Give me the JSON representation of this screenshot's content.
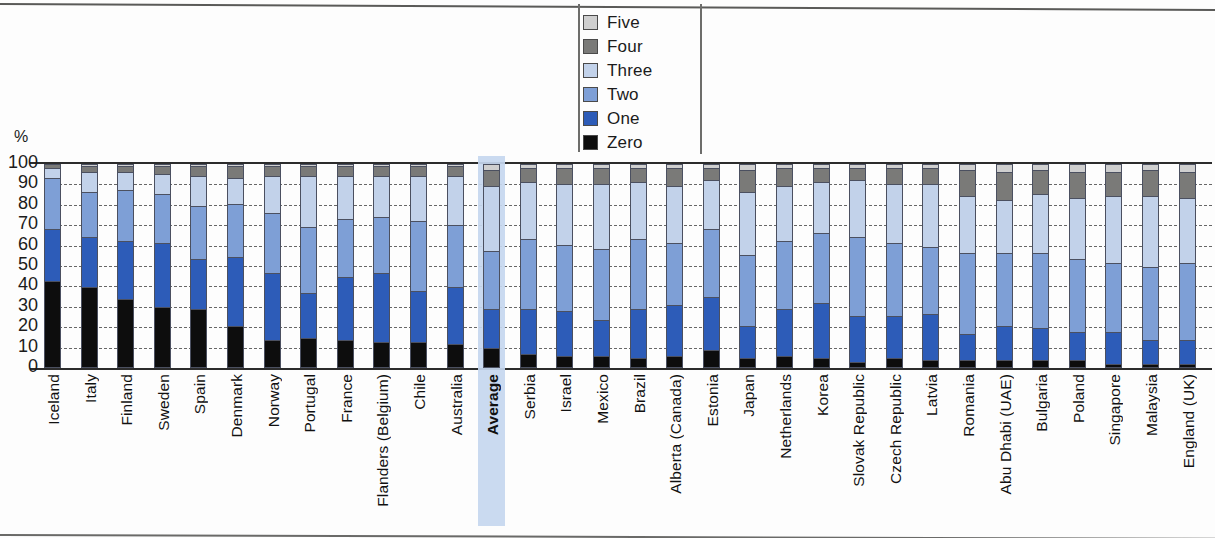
{
  "chart_data": {
    "type": "bar",
    "subtype": "stacked-bar-100",
    "title": "",
    "xlabel": "",
    "ylabel": "%",
    "ylim": [
      0,
      100
    ],
    "ytick_labels": [
      "100",
      "90",
      "80",
      "70",
      "60",
      "50",
      "40",
      "30",
      "20",
      "10",
      "0"
    ],
    "yticks": [
      100,
      90,
      80,
      70,
      60,
      50,
      40,
      30,
      20,
      10,
      0
    ],
    "grid": "horizontal-dashed",
    "legend_position": "top-center",
    "highlighted_category": "Average",
    "legend": [
      "Five",
      "Four",
      "Three",
      "Two",
      "One",
      "Zero"
    ],
    "colors": {
      "Five": "#cfcfcf",
      "Four": "#7a7a78",
      "Three": "#c2d2ea",
      "Two": "#7e9fd6",
      "One": "#2d5cb8",
      "Zero": "#0d0d0d"
    },
    "categories": [
      "Iceland",
      "Italy",
      "Finland",
      "Sweden",
      "Spain",
      "Denmark",
      "Norway",
      "Portugal",
      "France",
      "Flanders (Belgium)",
      "Chile",
      "Australia",
      "Average",
      "Serbia",
      "Israel",
      "Mexico",
      "Brazil",
      "Alberta (Canada)",
      "Estonia",
      "Japan",
      "Netherlands",
      "Korea",
      "Slovak Republic",
      "Czech Republic",
      "Latvia",
      "Romania",
      "Abu Dhabi (UAE)",
      "Bulgaria",
      "Poland",
      "Singapore",
      "Malaysia",
      "England (UK)"
    ],
    "series": [
      {
        "name": "Zero",
        "values": [
          42,
          39,
          33,
          29,
          28,
          20,
          13,
          14,
          13,
          12,
          12,
          11,
          9,
          6,
          5,
          5,
          4,
          5,
          8,
          4,
          5,
          4,
          2,
          4,
          3,
          3,
          3,
          3,
          3,
          1,
          1,
          1
        ]
      },
      {
        "name": "One",
        "values": [
          26,
          25,
          29,
          32,
          25,
          34,
          33,
          22,
          31,
          34,
          25,
          28,
          19,
          22,
          22,
          18,
          24,
          25,
          26,
          16,
          23,
          27,
          23,
          21,
          23,
          13,
          17,
          16,
          14,
          16,
          12,
          12
        ]
      },
      {
        "name": "Two",
        "values": [
          25,
          22,
          25,
          24,
          26,
          26,
          30,
          33,
          29,
          28,
          35,
          31,
          29,
          35,
          33,
          35,
          35,
          31,
          34,
          35,
          34,
          35,
          39,
          36,
          33,
          40,
          36,
          37,
          36,
          34,
          36,
          38
        ]
      },
      {
        "name": "Three",
        "values": [
          5,
          10,
          9,
          10,
          15,
          13,
          18,
          25,
          21,
          20,
          22,
          24,
          32,
          28,
          30,
          32,
          28,
          28,
          24,
          31,
          27,
          25,
          28,
          29,
          31,
          28,
          26,
          29,
          30,
          33,
          35,
          32
        ]
      },
      {
        "name": "Four",
        "values": [
          2,
          3,
          3,
          4,
          5,
          6,
          5,
          5,
          5,
          5,
          5,
          5,
          8,
          7,
          8,
          8,
          7,
          9,
          6,
          11,
          9,
          7,
          6,
          8,
          8,
          13,
          14,
          12,
          13,
          12,
          13,
          13
        ]
      },
      {
        "name": "Five",
        "values": [
          0,
          1,
          1,
          1,
          1,
          1,
          1,
          1,
          1,
          1,
          1,
          1,
          3,
          2,
          2,
          2,
          2,
          2,
          2,
          3,
          2,
          2,
          2,
          2,
          2,
          3,
          4,
          3,
          4,
          4,
          3,
          4
        ]
      }
    ]
  }
}
